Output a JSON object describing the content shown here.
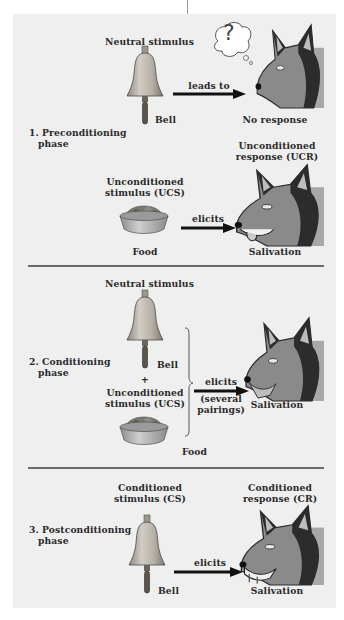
{
  "figure": {
    "colors": {
      "panel_background": "#efefef",
      "divider": "#6a6a6a",
      "arrow": "#111111",
      "bell": "#b8b2a8",
      "dog_backdrop": "#a8a8a8",
      "text": "#2a2a2a"
    }
  },
  "phases": [
    {
      "label_line1": "1. Preconditioning",
      "label_line2": "phase",
      "rows": [
        {
          "stimulus_heading": "Neutral stimulus",
          "stimulus_caption": "Bell",
          "arrow_label": "leads to",
          "response_caption": "No response",
          "thought_bubble_symbol": "?"
        },
        {
          "stimulus_heading_line1": "Unconditioned",
          "stimulus_heading_line2": "stimulus (UCS)",
          "stimulus_caption": "Food",
          "arrow_label": "elicits",
          "response_heading_line1": "Unconditioned",
          "response_heading_line2": "response (UCR)",
          "response_caption": "Salivation"
        }
      ]
    },
    {
      "label_line1": "2. Conditioning",
      "label_line2": "phase",
      "stimulus_heading": "Neutral stimulus",
      "bell_caption": "Bell",
      "plus": "+",
      "ucs_line1": "Unconditioned",
      "ucs_line2": "stimulus (UCS)",
      "food_caption": "Food",
      "arrow_label": "elicits",
      "arrow_sublabel_line1": "(several",
      "arrow_sublabel_line2": "pairings)",
      "response_caption": "Salivation"
    },
    {
      "label_line1": "3. Postconditioning",
      "label_line2": "phase",
      "stimulus_heading_line1": "Conditioned",
      "stimulus_heading_line2": "stimulus (CS)",
      "stimulus_caption": "Bell",
      "arrow_label": "elicits",
      "response_heading_line1": "Conditioned",
      "response_heading_line2": "response (CR)",
      "response_caption": "Salivation"
    }
  ]
}
